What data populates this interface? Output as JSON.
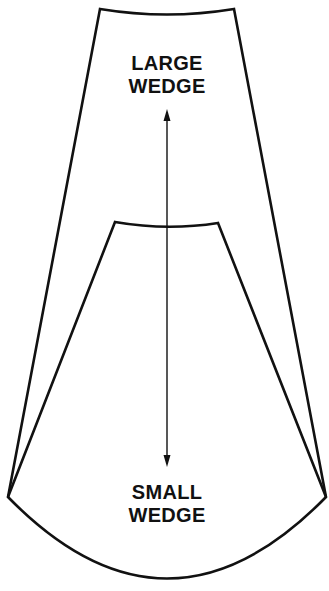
{
  "diagram": {
    "large_wedge": {
      "line1": "LARGE",
      "line2": "WEDGE"
    },
    "small_wedge": {
      "line1": "SMALL",
      "line2": "WEDGE"
    },
    "colors": {
      "stroke": "#111111",
      "background": "#ffffff"
    }
  }
}
